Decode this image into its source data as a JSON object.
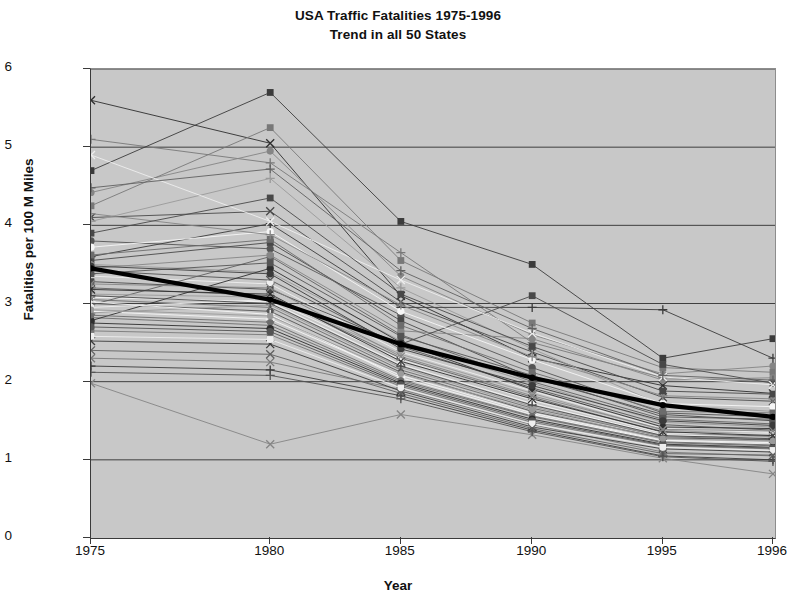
{
  "chart_data": {
    "type": "line",
    "title": "USA Traffic Fatalities 1975-1996",
    "subtitle": "Trend in all 50 States",
    "xlabel": "Year",
    "ylabel": "Fatalities per 100 M Miles",
    "categories": [
      "1975",
      "1980",
      "1985",
      "1990",
      "1995",
      "1996"
    ],
    "ylim": [
      0,
      6
    ],
    "yticks": [
      0,
      1,
      2,
      3,
      4,
      5,
      6
    ],
    "grid": "horizontal",
    "legend": "none",
    "plot_background": "#c8c8c8",
    "series": [
      {
        "name": "State 01",
        "marker": "x",
        "emphasis": false,
        "values": [
          5.6,
          5.05,
          3.1,
          2.3,
          1.95,
          1.85
        ]
      },
      {
        "name": "State 02",
        "marker": "plus",
        "emphasis": false,
        "values": [
          5.1,
          4.8,
          3.65,
          2.5,
          2.05,
          2.0
        ]
      },
      {
        "name": "State 03",
        "marker": "square",
        "emphasis": false,
        "values": [
          4.7,
          5.7,
          4.05,
          3.5,
          2.3,
          2.55
        ]
      },
      {
        "name": "State 04",
        "marker": "circle",
        "emphasis": false,
        "values": [
          4.42,
          4.95,
          3.35,
          2.6,
          2.1,
          2.2
        ]
      },
      {
        "name": "State 05",
        "marker": "x",
        "emphasis": false,
        "values": [
          4.1,
          4.18,
          3.02,
          2.38,
          1.8,
          1.75
        ]
      },
      {
        "name": "State 06",
        "marker": "plus",
        "emphasis": false,
        "values": [
          4.05,
          4.6,
          3.2,
          2.42,
          1.7,
          1.62
        ]
      },
      {
        "name": "State 07",
        "marker": "circle",
        "emphasis": false,
        "values": [
          3.8,
          3.7,
          2.85,
          2.18,
          1.6,
          1.55
        ]
      },
      {
        "name": "State 08",
        "marker": "square",
        "emphasis": false,
        "values": [
          3.55,
          3.78,
          2.78,
          2.05,
          1.58,
          1.5
        ]
      },
      {
        "name": "State 09",
        "marker": "dot",
        "emphasis": false,
        "values": [
          3.5,
          3.4,
          2.52,
          1.98,
          1.48,
          1.42
        ]
      },
      {
        "name": "State 10",
        "marker": "x",
        "emphasis": false,
        "values": [
          3.42,
          3.3,
          2.45,
          1.92,
          1.45,
          1.38
        ]
      },
      {
        "name": "State 11",
        "marker": "square",
        "emphasis": false,
        "values": [
          3.35,
          3.25,
          2.38,
          1.88,
          1.4,
          1.35
        ]
      },
      {
        "name": "State 12",
        "marker": "plus",
        "emphasis": false,
        "values": [
          3.2,
          3.1,
          2.3,
          1.8,
          1.35,
          1.3
        ]
      },
      {
        "name": "State 13",
        "marker": "circle",
        "emphasis": false,
        "values": [
          3.08,
          3.02,
          2.22,
          1.72,
          1.32,
          1.28
        ]
      },
      {
        "name": "State 14",
        "marker": "x",
        "emphasis": false,
        "values": [
          3.05,
          2.95,
          2.15,
          1.66,
          1.3,
          1.25
        ]
      },
      {
        "name": "State 15",
        "marker": "square",
        "emphasis": false,
        "values": [
          2.98,
          3.6,
          2.6,
          2.0,
          1.52,
          1.46
        ]
      },
      {
        "name": "State 16",
        "marker": "plus",
        "emphasis": false,
        "values": [
          2.9,
          2.8,
          2.08,
          1.6,
          1.25,
          1.22
        ]
      },
      {
        "name": "State 17",
        "marker": "x",
        "emphasis": false,
        "values": [
          2.82,
          2.72,
          2.0,
          1.55,
          1.22,
          1.18
        ]
      },
      {
        "name": "State 18",
        "marker": "circle",
        "emphasis": false,
        "values": [
          2.78,
          3.45,
          2.5,
          1.9,
          1.42,
          1.4
        ]
      },
      {
        "name": "State 19",
        "marker": "x",
        "emphasis": false,
        "values": [
          2.3,
          2.25,
          1.9,
          1.45,
          1.1,
          1.05
        ]
      },
      {
        "name": "State 20",
        "marker": "plus",
        "emphasis": false,
        "values": [
          2.2,
          2.15,
          1.82,
          1.38,
          1.05,
          1.0
        ]
      },
      {
        "name": "State 21",
        "marker": "x",
        "emphasis": false,
        "values": [
          1.98,
          1.2,
          1.58,
          1.32,
          1.02,
          0.82
        ]
      },
      {
        "name": "State 22",
        "marker": "square",
        "emphasis": false,
        "values": [
          4.25,
          5.25,
          3.55,
          2.75,
          2.18,
          2.12
        ]
      },
      {
        "name": "State 23",
        "marker": "plus",
        "emphasis": false,
        "values": [
          3.6,
          4.02,
          2.95,
          2.95,
          2.92,
          2.3
        ]
      },
      {
        "name": "State 24",
        "marker": "circle",
        "emphasis": false,
        "values": [
          3.45,
          3.62,
          2.65,
          2.55,
          2.02,
          2.05
        ]
      },
      {
        "name": "State 25",
        "marker": "square",
        "emphasis": false,
        "values": [
          3.28,
          3.18,
          2.48,
          3.1,
          2.22,
          1.98
        ]
      },
      {
        "name": "State 26",
        "marker": "x",
        "emphasis": false,
        "values": [
          3.12,
          3.08,
          2.35,
          1.85,
          1.38,
          1.32
        ]
      },
      {
        "name": "State 27",
        "marker": "dot",
        "emphasis": false,
        "values": [
          3.0,
          2.9,
          2.12,
          1.62,
          1.28,
          1.26
        ]
      },
      {
        "name": "State 28",
        "marker": "circle",
        "emphasis": false,
        "values": [
          2.95,
          3.05,
          2.28,
          1.76,
          1.34,
          1.33
        ]
      },
      {
        "name": "State 29",
        "marker": "plus",
        "emphasis": false,
        "values": [
          2.88,
          2.98,
          2.18,
          1.68,
          1.3,
          1.29
        ]
      },
      {
        "name": "State 30",
        "marker": "square",
        "emphasis": false,
        "values": [
          3.38,
          3.52,
          2.58,
          2.08,
          1.55,
          1.52
        ]
      },
      {
        "name": "State 31",
        "marker": "x",
        "emphasis": false,
        "values": [
          4.9,
          4.05,
          3.3,
          2.62,
          2.06,
          1.96
        ]
      },
      {
        "name": "State 32",
        "marker": "plus",
        "emphasis": false,
        "values": [
          4.48,
          4.72,
          3.42,
          2.68,
          2.08,
          2.02
        ]
      },
      {
        "name": "State 33",
        "marker": "circle",
        "emphasis": false,
        "values": [
          3.72,
          3.92,
          2.9,
          2.28,
          1.72,
          1.68
        ]
      },
      {
        "name": "State 34",
        "marker": "square",
        "emphasis": false,
        "values": [
          3.62,
          3.82,
          2.72,
          2.12,
          1.62,
          1.6
        ]
      },
      {
        "name": "State 35",
        "marker": "x",
        "emphasis": false,
        "values": [
          3.18,
          3.12,
          2.26,
          1.78,
          1.36,
          1.31
        ]
      },
      {
        "name": "State 36",
        "marker": "plus",
        "emphasis": false,
        "values": [
          3.02,
          2.86,
          2.05,
          1.58,
          1.24,
          1.2
        ]
      },
      {
        "name": "State 37",
        "marker": "dot",
        "emphasis": false,
        "values": [
          2.85,
          2.76,
          2.02,
          1.56,
          1.23,
          1.19
        ]
      },
      {
        "name": "State 38",
        "marker": "circle",
        "emphasis": false,
        "values": [
          2.75,
          2.68,
          1.98,
          1.52,
          1.2,
          1.16
        ]
      },
      {
        "name": "State 39",
        "marker": "square",
        "emphasis": false,
        "values": [
          2.65,
          2.6,
          1.94,
          1.48,
          1.18,
          1.14
        ]
      },
      {
        "name": "State 40",
        "marker": "x",
        "emphasis": false,
        "values": [
          2.52,
          2.48,
          1.88,
          1.42,
          1.14,
          1.1
        ]
      },
      {
        "name": "State 41",
        "marker": "plus",
        "emphasis": false,
        "values": [
          4.15,
          3.88,
          2.98,
          2.32,
          1.82,
          1.78
        ]
      },
      {
        "name": "State 42",
        "marker": "square",
        "emphasis": false,
        "values": [
          3.9,
          4.35,
          3.12,
          2.45,
          1.88,
          1.84
        ]
      },
      {
        "name": "State 43",
        "marker": "circle",
        "emphasis": false,
        "values": [
          3.48,
          3.38,
          2.42,
          1.95,
          1.5,
          1.44
        ]
      },
      {
        "name": "State 44",
        "marker": "x",
        "emphasis": false,
        "values": [
          3.25,
          3.2,
          2.32,
          1.82,
          1.39,
          1.37
        ]
      },
      {
        "name": "State 45",
        "marker": "plus",
        "emphasis": false,
        "values": [
          3.1,
          3.0,
          2.2,
          1.7,
          1.31,
          1.27
        ]
      },
      {
        "name": "State 46",
        "marker": "dot",
        "emphasis": false,
        "values": [
          2.92,
          2.84,
          2.1,
          1.64,
          1.27,
          1.24
        ]
      },
      {
        "name": "State 47",
        "marker": "circle",
        "emphasis": false,
        "values": [
          2.7,
          2.64,
          1.96,
          1.5,
          1.19,
          1.15
        ]
      },
      {
        "name": "State 48",
        "marker": "square",
        "emphasis": false,
        "values": [
          2.58,
          2.54,
          1.92,
          1.46,
          1.16,
          1.12
        ]
      },
      {
        "name": "State 49",
        "marker": "x",
        "emphasis": false,
        "values": [
          2.4,
          2.35,
          1.85,
          1.4,
          1.08,
          1.06
        ]
      },
      {
        "name": "State 50",
        "marker": "plus",
        "emphasis": false,
        "values": [
          2.12,
          2.08,
          1.78,
          1.36,
          1.04,
          0.98
        ]
      },
      {
        "name": "National Average",
        "marker": "dot",
        "emphasis": true,
        "values": [
          3.45,
          3.05,
          2.48,
          2.05,
          1.7,
          1.55
        ]
      }
    ]
  },
  "axes": {
    "y_tick_labels": [
      "6",
      "5",
      "4",
      "3",
      "2",
      "1",
      "0"
    ],
    "x_tick_labels": [
      "1975",
      "1980",
      "1985",
      "1990",
      "1995",
      "1996"
    ]
  }
}
